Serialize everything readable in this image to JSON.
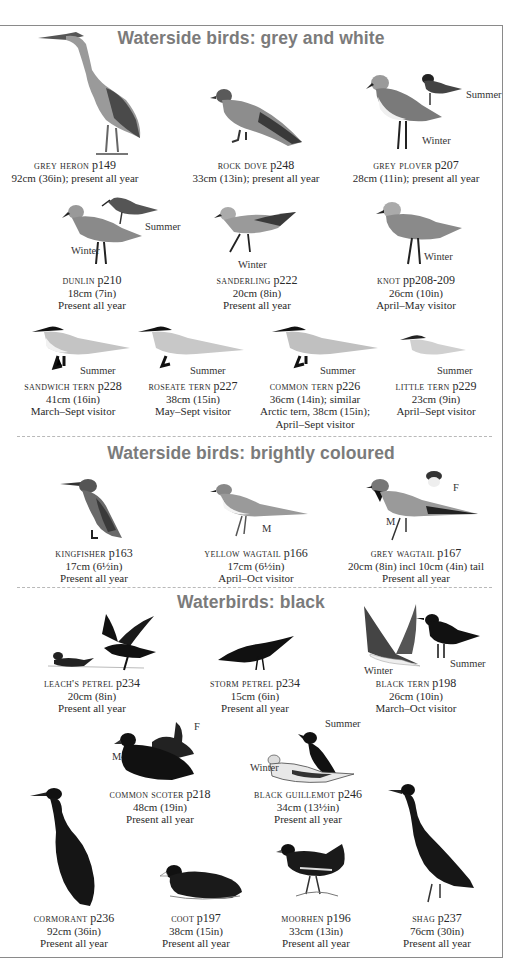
{
  "sections": [
    {
      "title": "Waterside birds: grey and white",
      "birds": [
        {
          "name": "GREY HERON",
          "page": "p149",
          "lines": [
            "92cm (36in); present all year"
          ]
        },
        {
          "name": "ROCK DOVE",
          "page": "p248",
          "lines": [
            "33cm (13in); present all year"
          ]
        },
        {
          "name": "GREY PLOVER",
          "page": "p207",
          "lines": [
            "28cm (11in); present all year"
          ],
          "plumage_labels": [
            "Summer",
            "Winter"
          ]
        },
        {
          "name": "DUNLIN",
          "page": "p210",
          "lines": [
            "18cm (7in)",
            "Present all year"
          ],
          "plumage_labels": [
            "Summer",
            "Winter"
          ]
        },
        {
          "name": "SANDERLING",
          "page": "p222",
          "lines": [
            "20cm (8in)",
            "Present all year"
          ],
          "plumage_labels": [
            "Winter"
          ]
        },
        {
          "name": "KNOT",
          "page": "pp208-209",
          "lines": [
            "26cm (10in)",
            "April–May visitor"
          ],
          "plumage_labels": [
            "Winter"
          ]
        },
        {
          "name": "SANDWICH TERN",
          "page": "p228",
          "lines": [
            "41cm (16in)",
            "March–Sept visitor"
          ],
          "plumage_labels": [
            "Summer"
          ]
        },
        {
          "name": "ROSEATE TERN",
          "page": "p227",
          "lines": [
            "38cm (15in)",
            "May–Sept visitor"
          ],
          "plumage_labels": [
            "Summer"
          ]
        },
        {
          "name": "COMMON TERN",
          "page": "p226",
          "lines": [
            "36cm (14in); similar",
            "Arctic tern, 38cm (15in);",
            "April–Sept visitor"
          ],
          "plumage_labels": [
            "Summer"
          ]
        },
        {
          "name": "LITTLE TERN",
          "page": "p229",
          "lines": [
            "23cm (9in)",
            "April–Sept visitor"
          ],
          "plumage_labels": [
            "Summer"
          ]
        }
      ]
    },
    {
      "title": "Waterside birds: brightly coloured",
      "birds": [
        {
          "name": "KINGFISHER",
          "page": "p163",
          "lines": [
            "17cm (6½in)",
            "Present all year"
          ]
        },
        {
          "name": "YELLOW WAGTAIL",
          "page": "p166",
          "lines": [
            "17cm (6½in)",
            "April–Oct visitor"
          ],
          "plumage_labels": [
            "M"
          ]
        },
        {
          "name": "GREY WAGTAIL",
          "page": "p167",
          "lines": [
            "20cm (8in) incl 10cm (4in) tail",
            "Present all year"
          ],
          "plumage_labels": [
            "M",
            "F"
          ]
        }
      ]
    },
    {
      "title": "Waterbirds: black",
      "birds": [
        {
          "name": "LEACH'S PETREL",
          "page": "p234",
          "lines": [
            "20cm (8in)",
            "Present all year"
          ]
        },
        {
          "name": "STORM PETREL",
          "page": "p234",
          "lines": [
            "15cm (6in)",
            "Present all year"
          ]
        },
        {
          "name": "BLACK TERN",
          "page": "p198",
          "lines": [
            "26cm (10in)",
            "March–Oct visitor"
          ],
          "plumage_labels": [
            "Winter",
            "Summer"
          ]
        },
        {
          "name": "COMMON SCOTER",
          "page": "p218",
          "lines": [
            "48cm (19in)",
            "Present all year"
          ],
          "plumage_labels": [
            "M",
            "F"
          ]
        },
        {
          "name": "BLACK GUILLEMOT",
          "page": "p246",
          "lines": [
            "34cm (13½in)",
            "Present all year"
          ],
          "plumage_labels": [
            "Summer",
            "Winter"
          ]
        },
        {
          "name": "CORMORANT",
          "page": "p236",
          "lines": [
            "92cm (36in)",
            "Present all year"
          ]
        },
        {
          "name": "COOT",
          "page": "p197",
          "lines": [
            "38cm (15in)",
            "Present all year"
          ]
        },
        {
          "name": "MOORHEN",
          "page": "p196",
          "lines": [
            "33cm (13in)",
            "Present all year"
          ]
        },
        {
          "name": "SHAG",
          "page": "p237",
          "lines": [
            "76cm (30in)",
            "Present all year"
          ]
        }
      ]
    }
  ]
}
